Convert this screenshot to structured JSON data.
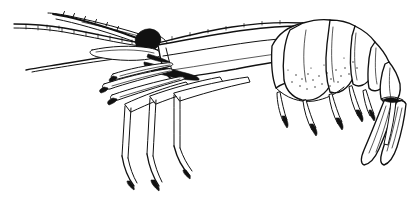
{
  "figure": {
    "title": "Shrimp lateral view line illustration",
    "subject": "shrimp",
    "view": "lateral, facing left",
    "medium": "black ink line drawing",
    "background_color": "#ffffff",
    "ink_color": "#111111",
    "canvas": {
      "width": 416,
      "height": 199
    },
    "has_text_labels": false,
    "parts": [
      {
        "id": "antenna-long-upper",
        "label": "long upper antenna (flagellum)"
      },
      {
        "id": "antenna-long-lower",
        "label": "long lower antenna (flagellum)"
      },
      {
        "id": "antennule",
        "label": "antennule"
      },
      {
        "id": "rostrum",
        "label": "rostrum with dorsal teeth"
      },
      {
        "id": "eye",
        "label": "compound eye on stalk"
      },
      {
        "id": "antennal-scale",
        "label": "antennal scale (scaphocerite)"
      },
      {
        "id": "carapace",
        "label": "carapace"
      },
      {
        "id": "maxillipeds",
        "label": "maxillipeds"
      },
      {
        "id": "pereiopods",
        "label": "walking legs (pereiopods)"
      },
      {
        "id": "abdomen-segments",
        "label": "abdominal somites with pleura"
      },
      {
        "id": "pleopods",
        "label": "pleopods (swimmerets)"
      },
      {
        "id": "telson",
        "label": "telson"
      },
      {
        "id": "uropods",
        "label": "uropods (tail fan)"
      }
    ]
  }
}
